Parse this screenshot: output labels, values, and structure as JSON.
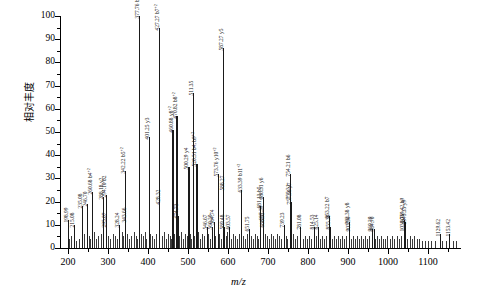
{
  "chart_data": {
    "type": "bar",
    "title": "",
    "xlabel": "m/z",
    "ylabel": "相对丰度",
    "xlim": [
      180,
      1180
    ],
    "ylim": [
      0,
      100
    ],
    "grid": false,
    "legend": "none",
    "xticks": [
      200,
      300,
      400,
      500,
      600,
      700,
      800,
      900,
      1000,
      1100
    ],
    "yticks": [
      0,
      10,
      20,
      30,
      40,
      50,
      60,
      70,
      80,
      90,
      100
    ],
    "categories": [
      198.99,
      215.08,
      235.08,
      246.7,
      260.68,
      288.18,
      294.1,
      295.07,
      328.24,
      342.22,
      343.66,
      377.76,
      401.25,
      428.32,
      460.88,
      470.82,
      474.73,
      500.29,
      511.35,
      520.51,
      546.67,
      560.2,
      564.74,
      573.76,
      587.27,
      588.27,
      589.48,
      603.57,
      633.39,
      651.75,
      681.13,
      686.31,
      687.39,
      688.35,
      739.23,
      754.21,
      755.31,
      757.3,
      781.08,
      814.53,
      825.14,
      853.22,
      855.39,
      902.38,
      903.3,
      960.29,
      964.7,
      1038.76,
      1039.42,
      1043.33,
      1129.62,
      1153.42,
      427.27
    ],
    "values": [
      12,
      10,
      18,
      19,
      24,
      22,
      23,
      10,
      10,
      33,
      12,
      100,
      48,
      20,
      51,
      57,
      14,
      35,
      67,
      36,
      9,
      9,
      11,
      32,
      86,
      26,
      9,
      9,
      25,
      8,
      18,
      22,
      13,
      10,
      10,
      32,
      22,
      20,
      9,
      9,
      9,
      14,
      9,
      11,
      8,
      8,
      8,
      8,
      12,
      11,
      6,
      6,
      95
    ],
    "annotations": [
      {
        "mz": "198.99",
        "ion": "",
        "intensity": 12
      },
      {
        "mz": "215.08",
        "ion": "",
        "intensity": 10
      },
      {
        "mz": "235.08",
        "ion": "",
        "intensity": 18
      },
      {
        "mz": "246.70",
        "ion": "",
        "intensity": 19
      },
      {
        "mz": "260.68",
        "ion": "b4⁺²",
        "intensity": 24
      },
      {
        "mz": "288.18",
        "ion": "y2",
        "intensity": 22
      },
      {
        "mz": "294.10",
        "ion": "b2",
        "intensity": 23
      },
      {
        "mz": "295.07",
        "ion": "",
        "intensity": 10
      },
      {
        "mz": "328.24",
        "ion": "",
        "intensity": 10
      },
      {
        "mz": "342.22",
        "ion": "b5⁺²",
        "intensity": 33
      },
      {
        "mz": "343.66",
        "ion": "",
        "intensity": 12
      },
      {
        "mz": "377.76",
        "ion": "b6⁺²",
        "intensity": 100
      },
      {
        "mz": "401.25",
        "ion": "y3",
        "intensity": 48
      },
      {
        "mz": "427.27",
        "ion": "b7⁺²",
        "intensity": 95
      },
      {
        "mz": "428.32",
        "ion": "",
        "intensity": 20
      },
      {
        "mz": "460.88",
        "ion": "y8⁺²",
        "intensity": 51
      },
      {
        "mz": "470.82",
        "ion": "b8⁺²",
        "intensity": 57
      },
      {
        "mz": "474.73",
        "ion": "",
        "intensity": 14
      },
      {
        "mz": "500.29",
        "ion": "y4",
        "intensity": 35
      },
      {
        "mz": "511.35",
        "ion": "",
        "intensity": 67
      },
      {
        "mz": "520.51",
        "ion": "b4, b9⁺²",
        "intensity": 36
      },
      {
        "mz": "546.67",
        "ion": "",
        "intensity": 9
      },
      {
        "mz": "560.20",
        "ion": "",
        "intensity": 9
      },
      {
        "mz": "564.74",
        "ion": "",
        "intensity": 11
      },
      {
        "mz": "573.76",
        "ion": "y10⁺²",
        "intensity": 32
      },
      {
        "mz": "587.27",
        "ion": "y5",
        "intensity": 86
      },
      {
        "mz": "588.27",
        "ion": "",
        "intensity": 26
      },
      {
        "mz": "589.48",
        "ion": "",
        "intensity": 9
      },
      {
        "mz": "603.57",
        "ion": "",
        "intensity": 9
      },
      {
        "mz": "633.39",
        "ion": "b11⁺²",
        "intensity": 25
      },
      {
        "mz": "651.75",
        "ion": "",
        "intensity": 8
      },
      {
        "mz": "681.13",
        "ion": "b5",
        "intensity": 18
      },
      {
        "mz": "686.31",
        "ion": "y6",
        "intensity": 22
      },
      {
        "mz": "687.39",
        "ion": "",
        "intensity": 13
      },
      {
        "mz": "688.35",
        "ion": "",
        "intensity": 10
      },
      {
        "mz": "739.23",
        "ion": "",
        "intensity": 10
      },
      {
        "mz": "754.21",
        "ion": "b6",
        "intensity": 32
      },
      {
        "mz": "755.31",
        "ion": "",
        "intensity": 22
      },
      {
        "mz": "757.30",
        "ion": "y7",
        "intensity": 20
      },
      {
        "mz": "781.08",
        "ion": "",
        "intensity": 9
      },
      {
        "mz": "814.53",
        "ion": "",
        "intensity": 9
      },
      {
        "mz": "825.14",
        "ion": "",
        "intensity": 9
      },
      {
        "mz": "853.22",
        "ion": "b7",
        "intensity": 14
      },
      {
        "mz": "855.39",
        "ion": "",
        "intensity": 9
      },
      {
        "mz": "902.38",
        "ion": "y8",
        "intensity": 11
      },
      {
        "mz": "903.30",
        "ion": "",
        "intensity": 8
      },
      {
        "mz": "960.29",
        "ion": "",
        "intensity": 8
      },
      {
        "mz": "964.70",
        "ion": "",
        "intensity": 8
      },
      {
        "mz": "1038.76",
        "ion": "",
        "intensity": 8
      },
      {
        "mz": "1039.42",
        "ion": "b9",
        "intensity": 12
      },
      {
        "mz": "1043.33",
        "ion": "y9",
        "intensity": 11
      },
      {
        "mz": "1129.62",
        "ion": "",
        "intensity": 6
      },
      {
        "mz": "1153.42",
        "ion": "",
        "intensity": 6
      }
    ]
  },
  "axes": {
    "y_title": "相对丰度",
    "x_title": "m/z",
    "y_tick_labels": [
      "0",
      "10",
      "20",
      "30",
      "40",
      "50",
      "60",
      "70",
      "80",
      "90",
      "100"
    ],
    "x_tick_labels": [
      "200",
      "300",
      "400",
      "500",
      "600",
      "700",
      "800",
      "900",
      "1000",
      "1100"
    ]
  },
  "peak_labels": [
    {
      "text": "198.99",
      "sup": ""
    },
    {
      "text": "215.08",
      "sup": ""
    },
    {
      "text": "235.08",
      "sup": ""
    },
    {
      "text": "246.70",
      "sup": ""
    },
    {
      "text": "260.68 b4",
      "sup": "+2"
    },
    {
      "text": "288.18 y2",
      "sup": ""
    },
    {
      "text": "294.10 b2",
      "sup": ""
    },
    {
      "text": "295.07",
      "sup": ""
    },
    {
      "text": "328.24",
      "sup": ""
    },
    {
      "text": "342.22 b5",
      "sup": "+2"
    },
    {
      "text": "343.66",
      "sup": ""
    },
    {
      "text": "377.76 b6",
      "sup": "+2"
    },
    {
      "text": "401.25 y3",
      "sup": ""
    },
    {
      "text": "427.27 b7",
      "sup": "+2"
    },
    {
      "text": "428.32",
      "sup": ""
    },
    {
      "text": "460.88 y8",
      "sup": "+2"
    },
    {
      "text": "470.82 b8",
      "sup": "+2"
    },
    {
      "text": "474.73",
      "sup": ""
    },
    {
      "text": "500.29 y4",
      "sup": ""
    },
    {
      "text": "511.35",
      "sup": ""
    },
    {
      "text": "520.51 b4, b9",
      "sup": "+2"
    },
    {
      "text": "546.67",
      "sup": ""
    },
    {
      "text": "560.20",
      "sup": ""
    },
    {
      "text": "564.74",
      "sup": ""
    },
    {
      "text": "573.76 y10",
      "sup": "+2"
    },
    {
      "text": "587.27 y5",
      "sup": ""
    },
    {
      "text": "588.27",
      "sup": ""
    },
    {
      "text": "589.48",
      "sup": ""
    },
    {
      "text": "603.57",
      "sup": ""
    },
    {
      "text": "633.39 b11",
      "sup": "+2"
    },
    {
      "text": "651.75",
      "sup": ""
    },
    {
      "text": "681.13 b5",
      "sup": ""
    },
    {
      "text": "686.31 y6",
      "sup": ""
    },
    {
      "text": "687.39",
      "sup": ""
    },
    {
      "text": "688.35",
      "sup": ""
    },
    {
      "text": "739.23",
      "sup": ""
    },
    {
      "text": "754.21 b6",
      "sup": ""
    },
    {
      "text": "755.31",
      "sup": ""
    },
    {
      "text": "757.30 y7",
      "sup": ""
    },
    {
      "text": "781.08",
      "sup": ""
    },
    {
      "text": "814.53",
      "sup": ""
    },
    {
      "text": "825.14",
      "sup": ""
    },
    {
      "text": "853.22 b7",
      "sup": ""
    },
    {
      "text": "855.39",
      "sup": ""
    },
    {
      "text": "902.38 y8",
      "sup": ""
    },
    {
      "text": "903.30",
      "sup": ""
    },
    {
      "text": "960.29",
      "sup": ""
    },
    {
      "text": "964.70",
      "sup": ""
    },
    {
      "text": "1038.76",
      "sup": ""
    },
    {
      "text": "1039.42 b9",
      "sup": ""
    },
    {
      "text": "1043.33 y9",
      "sup": ""
    },
    {
      "text": "1129.62",
      "sup": ""
    },
    {
      "text": "1153.42",
      "sup": ""
    }
  ]
}
